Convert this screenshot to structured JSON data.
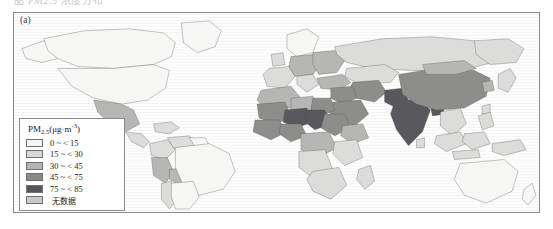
{
  "figure": {
    "panel_label": "(a)",
    "top_bleed_text": "图   PM2.5 浓度分布"
  },
  "legend": {
    "title_main": "PM",
    "title_sub": "2.5",
    "title_units": "(μg·m",
    "title_units_sup": "-3",
    "title_units_close": ")",
    "title_full": "PM2.5(μg·m-3)",
    "items": [
      {
        "label": "0 ~ < 15",
        "color": "#f4f4f2",
        "min": 0,
        "max": 15
      },
      {
        "label": "15 ~ < 30",
        "color": "#d8d8d6",
        "min": 15,
        "max": 30
      },
      {
        "label": "30 ~ < 45",
        "color": "#b3b3b1",
        "min": 30,
        "max": 45
      },
      {
        "label": "45 ~ < 75",
        "color": "#8a8a88",
        "min": 45,
        "max": 75
      },
      {
        "label": "75 ~ < 85",
        "color": "#55555a",
        "min": 75,
        "max": 85
      },
      {
        "label": "无数据",
        "color": "#c9c9c7",
        "min": null,
        "max": null
      }
    ]
  },
  "map_data": {
    "type": "choropleth",
    "projection": "equirectangular-world",
    "variable": "PM2.5 annual mean concentration",
    "units": "μg·m⁻³",
    "regions": [
      {
        "name": "Canada",
        "class": "c0"
      },
      {
        "name": "United States",
        "class": "c0"
      },
      {
        "name": "Greenland",
        "class": "c0"
      },
      {
        "name": "Alaska",
        "class": "c0"
      },
      {
        "name": "Mexico",
        "class": "c2"
      },
      {
        "name": "Central America",
        "class": "c1"
      },
      {
        "name": "Caribbean",
        "class": "c1"
      },
      {
        "name": "Colombia",
        "class": "c1"
      },
      {
        "name": "Venezuela",
        "class": "c1"
      },
      {
        "name": "Brazil",
        "class": "c0"
      },
      {
        "name": "Peru",
        "class": "c2"
      },
      {
        "name": "Bolivia",
        "class": "c2"
      },
      {
        "name": "Chile",
        "class": "c1"
      },
      {
        "name": "Argentina",
        "class": "c0"
      },
      {
        "name": "Western Europe",
        "class": "c1"
      },
      {
        "name": "Eastern Europe",
        "class": "c2"
      },
      {
        "name": "Scandinavia",
        "class": "c0"
      },
      {
        "name": "Russia",
        "class": "c1"
      },
      {
        "name": "Turkey",
        "class": "c2"
      },
      {
        "name": "Middle East",
        "class": "c3"
      },
      {
        "name": "Saudi Arabia",
        "class": "c3"
      },
      {
        "name": "Iran",
        "class": "c3"
      },
      {
        "name": "North Africa",
        "class": "c2"
      },
      {
        "name": "Egypt",
        "class": "c3"
      },
      {
        "name": "Mali",
        "class": "c3"
      },
      {
        "name": "Niger",
        "class": "c4"
      },
      {
        "name": "Chad",
        "class": "c4"
      },
      {
        "name": "Nigeria",
        "class": "c3"
      },
      {
        "name": "Sudan",
        "class": "c3"
      },
      {
        "name": "Ethiopia",
        "class": "c2"
      },
      {
        "name": "Central Africa",
        "class": "c2"
      },
      {
        "name": "Southern Africa",
        "class": "c1"
      },
      {
        "name": "Madagascar",
        "class": "c1"
      },
      {
        "name": "India",
        "class": "c4"
      },
      {
        "name": "Pakistan",
        "class": "c4"
      },
      {
        "name": "Bangladesh",
        "class": "c4"
      },
      {
        "name": "Nepal",
        "class": "c3"
      },
      {
        "name": "China",
        "class": "c3"
      },
      {
        "name": "Mongolia",
        "class": "c2"
      },
      {
        "name": "Kazakhstan",
        "class": "c1"
      },
      {
        "name": "Southeast Asia",
        "class": "c1"
      },
      {
        "name": "Indonesia",
        "class": "c1"
      },
      {
        "name": "Japan",
        "class": "c1"
      },
      {
        "name": "Korea",
        "class": "c2"
      },
      {
        "name": "Australia",
        "class": "c0"
      },
      {
        "name": "New Zealand",
        "class": "c0"
      }
    ]
  }
}
